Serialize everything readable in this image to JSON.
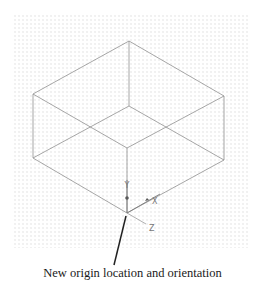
{
  "figure": {
    "caption": "New origin location and orientation",
    "background": "#ffffff",
    "grid": {
      "style": "dotted",
      "color": "#dcdcdc"
    },
    "box": {
      "edge_color": "#8a8a8a",
      "vertices": {
        "top_back": [
          129,
          41
        ],
        "left_top": [
          33,
          94
        ],
        "right_top": [
          224,
          96
        ],
        "front_top": [
          127,
          148
        ],
        "left_bottom": [
          33,
          158
        ],
        "right_bottom": [
          224,
          160
        ],
        "back_bottom_hidden": [
          129,
          106
        ],
        "front_bottom": [
          127,
          213
        ]
      }
    },
    "ucs_icon": {
      "origin": [
        127,
        213
      ],
      "axes": [
        {
          "name": "Y",
          "label": "Y"
        },
        {
          "name": "X",
          "label": "X"
        },
        {
          "name": "Z",
          "label": "Z"
        }
      ]
    },
    "leader": {
      "from": [
        126,
        216
      ],
      "to": [
        114,
        265
      ],
      "color": "#222222"
    }
  }
}
